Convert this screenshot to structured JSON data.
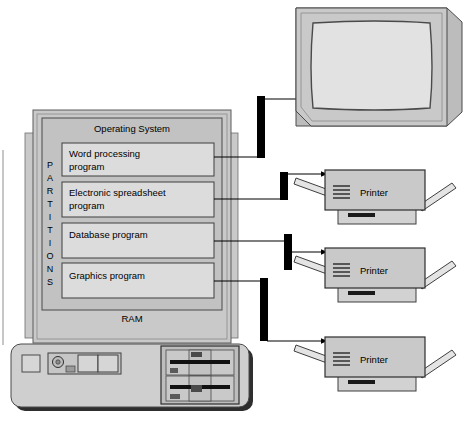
{
  "diagram": {
    "computer": {
      "ram_label": "RAM",
      "os_label": "Operating System",
      "partitions_label": "PARTITIONS",
      "partitions_letters": [
        "P",
        "A",
        "R",
        "T",
        "I",
        "T",
        "I",
        "O",
        "N",
        "S"
      ],
      "programs": [
        {
          "line1": "Word processing",
          "line2": "program"
        },
        {
          "line1": "Electronic spreadsheet",
          "line2": "program"
        },
        {
          "line1": "Database program",
          "line2": ""
        },
        {
          "line1": "Graphics program",
          "line2": ""
        }
      ]
    },
    "devices": [
      {
        "type": "monitor",
        "label": ""
      },
      {
        "type": "printer",
        "label": "Printer"
      },
      {
        "type": "printer",
        "label": "Printer"
      },
      {
        "type": "printer",
        "label": "Printer"
      }
    ],
    "colors": {
      "case_fill": "#c9c9c9",
      "os_fill": "#c2c2c2",
      "program_fill": "#dcdcdc",
      "device_fill": "#c9c9c9",
      "screen_fill": "#e0e0e0",
      "base_fill": "#d2d2d2",
      "connector": "#000000",
      "outline": "#3c3c3c",
      "shadow": "#5a5a5a"
    }
  }
}
